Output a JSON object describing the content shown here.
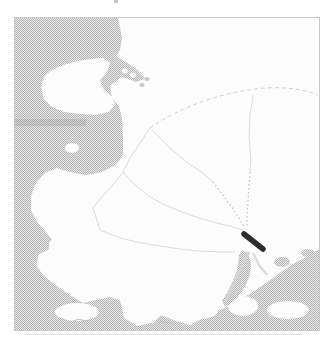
{
  "map": {
    "description": "Grayscale halftone map figure of a coastal region: stippled sea on the west and south, white landmass with a faint dendritic river network converging to a dark site marker near an estuary on the southeast coast",
    "frame": {
      "x": 14,
      "y": 17,
      "width": 306,
      "height": 314
    },
    "palette": {
      "page_bg": "#ffffff",
      "land": "#fdfdfd",
      "water_base": "#e9e9e9",
      "water_dot": "#b4b4b4",
      "water_flat": "#cbcbcb",
      "water_dark": "#a8a8a8",
      "river": "#dcdcdc",
      "river_dash": "#d3d3d3",
      "river_dot": "#bfbfbf",
      "marker": "#2d2d2d",
      "frame_line": "#c9c9c9",
      "shadow_line": "#e2e2e2",
      "caption_mark": "#9a9a9a"
    },
    "marker": {
      "x1": 244,
      "y1": 234,
      "x2": 263,
      "y2": 249,
      "width": 5.5
    },
    "layers": [
      {
        "name": "land-base",
        "kind": "rect",
        "attrs": {
          "x": 14,
          "y": 17,
          "width": 306,
          "height": 314,
          "fill": "$land"
        }
      },
      {
        "name": "sea-water",
        "kind": "polygon",
        "attrs": {
          "points": "14,17 118,17 122,38 120,50 116,56 126,62 138,70 145,79 136,82 122,77 110,86 112,98 119,106 122,118 123,137 123,155 116,165 102,172 86,175 70,172 56,168 45,173 36,183 31,196 31,210 37,222 46,232 52,240 48,250 39,254 36,265 44,276 57,286 70,295 83,303 96,300 110,297 124,302 138,308 152,313 166,317 179,322 190,325 203,318 217,311 231,305 245,297 257,289 269,281 281,272 293,264 306,257 318,250 320,249 320,331 14,331",
          "fill": "url(#halftone)"
        }
      },
      {
        "name": "peninsula-land",
        "kind": "polygon",
        "attrs": {
          "points": "50,71 63,65 77,61 91,59 103,58 110,63 107,72 100,80 104,90 112,97 115,104 109,112 96,115 80,114 64,112 52,107 44,99 41,87 44,77",
          "fill": "$land"
        }
      },
      {
        "name": "dark-water-band",
        "kind": "rect",
        "attrs": {
          "x": 14,
          "y": 119,
          "width": 72,
          "height": 7,
          "fill": "$water_dark",
          "opacity": 0.45
        }
      },
      {
        "name": "channel-islet-1",
        "kind": "ellipse",
        "attrs": {
          "cx": 125,
          "cy": 71,
          "rx": 3,
          "ry": 2.4,
          "fill": "$land"
        }
      },
      {
        "name": "channel-islet-2",
        "kind": "ellipse",
        "attrs": {
          "cx": 133,
          "cy": 75,
          "rx": 3,
          "ry": 2.4,
          "fill": "$land"
        }
      },
      {
        "name": "arm-islet-1",
        "kind": "ellipse",
        "attrs": {
          "cx": 147,
          "cy": 79,
          "rx": 2.6,
          "ry": 2,
          "fill": "$water_flat"
        }
      },
      {
        "name": "arm-islet-2",
        "kind": "ellipse",
        "attrs": {
          "cx": 142,
          "cy": 85,
          "rx": 2.6,
          "ry": 2,
          "fill": "$water_flat"
        }
      },
      {
        "name": "bay-islet",
        "kind": "ellipse",
        "attrs": {
          "cx": 72,
          "cy": 148,
          "rx": 7,
          "ry": 5,
          "fill": "$land"
        }
      },
      {
        "name": "inlet-islet",
        "kind": "ellipse",
        "attrs": {
          "cx": 55,
          "cy": 244,
          "rx": 6,
          "ry": 5,
          "fill": "$land"
        }
      },
      {
        "name": "bottom-island-1",
        "kind": "ellipse",
        "attrs": {
          "cx": 77,
          "cy": 312,
          "rx": 22,
          "ry": 9,
          "fill": "$land"
        }
      },
      {
        "name": "bottom-island-2",
        "kind": "polygon",
        "attrs": {
          "points": "120,300 140,296 158,302 163,312 155,322 138,326 124,318",
          "fill": "$land"
        }
      },
      {
        "name": "bottom-island-3",
        "kind": "ellipse",
        "attrs": {
          "cx": 198,
          "cy": 311,
          "rx": 20,
          "ry": 8,
          "fill": "$land"
        }
      },
      {
        "name": "bottom-island-4",
        "kind": "ellipse",
        "attrs": {
          "cx": 243,
          "cy": 306,
          "rx": 15,
          "ry": 10,
          "fill": "$land"
        }
      },
      {
        "name": "bottom-island-5",
        "kind": "ellipse",
        "attrs": {
          "cx": 288,
          "cy": 310,
          "rx": 21,
          "ry": 9,
          "fill": "$land"
        }
      },
      {
        "name": "se-islet-1",
        "kind": "ellipse",
        "attrs": {
          "cx": 282,
          "cy": 262,
          "rx": 8,
          "ry": 5,
          "fill": "url(#halftone)"
        }
      },
      {
        "name": "se-islet-2",
        "kind": "ellipse",
        "attrs": {
          "cx": 300,
          "cy": 270,
          "rx": 10,
          "ry": 6,
          "fill": "url(#halftone)"
        }
      },
      {
        "name": "se-islet-3",
        "kind": "ellipse",
        "attrs": {
          "cx": 308,
          "cy": 253,
          "rx": 7,
          "ry": 4,
          "fill": "url(#halftone)"
        }
      },
      {
        "name": "se-islet-4",
        "kind": "ellipse",
        "attrs": {
          "cx": 292,
          "cy": 280,
          "rx": 8,
          "ry": 5,
          "fill": "url(#halftone)"
        }
      },
      {
        "name": "estuary",
        "kind": "polygon",
        "attrs": {
          "points": "242,250 248,253 251,263 250,275 245,287 238,297 230,304 225,307 222,301 228,291 234,279 238,266 239,255",
          "fill": "url(#halftone)"
        }
      },
      {
        "name": "estuary-streak-1",
        "kind": "polyline",
        "attrs": {
          "points": "249,252 240,270 231,288 226,301",
          "fill": "none",
          "stroke": "$river_dash",
          "stroke-width": 3
        }
      },
      {
        "name": "estuary-streak-2",
        "kind": "polyline",
        "attrs": {
          "points": "253,253 259,265 267,275",
          "fill": "none",
          "stroke": "$river",
          "stroke-width": 2.5
        }
      },
      {
        "name": "river-main-dashed",
        "kind": "path",
        "attrs": {
          "d": "M150,128 C178,108 216,95 248,90 C272,86 300,87 318,95",
          "fill": "none",
          "stroke": "$river_dash",
          "stroke-width": 1,
          "stroke-dasharray": "4 3"
        }
      },
      {
        "name": "river-upper-west",
        "kind": "polyline",
        "attrs": {
          "points": "150,128 140,143 130,158 123,172",
          "fill": "none",
          "stroke": "$river",
          "stroke-width": 1
        }
      },
      {
        "name": "river-west-a",
        "kind": "polyline",
        "attrs": {
          "points": "123,172 112,186 101,198 93,208",
          "fill": "none",
          "stroke": "$river",
          "stroke-width": 1
        }
      },
      {
        "name": "river-west-b",
        "kind": "polyline",
        "attrs": {
          "points": "123,172 136,186 150,197 165,205 182,212 199,218 217,223 233,227 243,230",
          "fill": "none",
          "stroke": "$river",
          "stroke-width": 1
        }
      },
      {
        "name": "river-mid",
        "kind": "polyline",
        "attrs": {
          "points": "152,130 170,148 188,163 203,173 213,182",
          "fill": "none",
          "stroke": "$river",
          "stroke-width": 1
        }
      },
      {
        "name": "river-north",
        "kind": "polyline",
        "attrs": {
          "points": "253,95 250,115 249,138 251,160 250,172",
          "fill": "none",
          "stroke": "$river",
          "stroke-width": 1
        }
      },
      {
        "name": "river-south-a",
        "kind": "polyline",
        "attrs": {
          "points": "93,208 97,220 100,230",
          "fill": "none",
          "stroke": "$river",
          "stroke-width": 1
        }
      },
      {
        "name": "river-south-b",
        "kind": "polyline",
        "attrs": {
          "points": "100,230 120,238 141,243 160,246",
          "fill": "none",
          "stroke": "$river",
          "stroke-width": 1
        }
      },
      {
        "name": "river-south-c",
        "kind": "polyline",
        "attrs": {
          "points": "160,246 180,249 200,251 220,252 235,252",
          "fill": "none",
          "stroke": "$river",
          "stroke-width": 1
        }
      },
      {
        "name": "dotted-branch-west",
        "kind": "polyline",
        "attrs": {
          "points": "213,182 222,194 231,206 239,218 245,228",
          "fill": "none",
          "stroke": "$river_dot",
          "stroke-width": 1.2,
          "stroke-dasharray": "1.5 2.5"
        }
      },
      {
        "name": "dotted-branch-north",
        "kind": "polyline",
        "attrs": {
          "points": "250,172 249,186 248,201 247,215 247,227",
          "fill": "none",
          "stroke": "$river_dot",
          "stroke-width": 1.2,
          "stroke-dasharray": "1.5 2.5"
        }
      },
      {
        "name": "site-marker",
        "kind": "line",
        "attrs": {
          "x1": 244,
          "y1": 234,
          "x2": 263,
          "y2": 249,
          "stroke": "$marker",
          "stroke-width": 5.5,
          "stroke-linecap": "round"
        }
      },
      {
        "name": "coast-squiggle-1",
        "kind": "path",
        "attrs": {
          "d": "M74,321 q4,-3 8,-1 q4,2 8,0",
          "fill": "none",
          "stroke": "$river_dot",
          "stroke-width": 1
        }
      },
      {
        "name": "coast-squiggle-2",
        "kind": "path",
        "attrs": {
          "d": "M158,323 q3,-2 6,-1 q3,1 6,0",
          "fill": "none",
          "stroke": "$river_dot",
          "stroke-width": 0.8
        }
      },
      {
        "name": "map-frame",
        "kind": "rect",
        "attrs": {
          "x": 14.5,
          "y": 17.5,
          "width": 305,
          "height": 313,
          "fill": "none",
          "stroke": "$frame_line",
          "stroke-width": 1
        }
      },
      {
        "name": "frame-shadow-line",
        "kind": "line",
        "attrs": {
          "x1": 24,
          "y1": 334.5,
          "x2": 302,
          "y2": 334.5,
          "stroke": "$shadow_line",
          "stroke-width": 1
        }
      },
      {
        "name": "cropped-caption-mark",
        "kind": "rect",
        "attrs": {
          "x": 114,
          "y": 0,
          "width": 4,
          "height": 3,
          "fill": "$caption_mark",
          "opacity": 0.55
        }
      }
    ]
  }
}
